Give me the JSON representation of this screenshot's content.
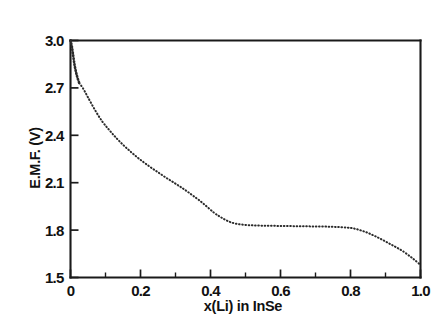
{
  "figure": {
    "background_color": "#ffffff",
    "ink_color": "#1a1a1a",
    "curve_color": "#2b2b2b"
  },
  "chart_data": {
    "type": "line",
    "title": "",
    "subtitle": "",
    "xlabel": "x(Li) in InSe",
    "ylabel": "E.M.F. (V)",
    "xlim": [
      0,
      1.0
    ],
    "ylim": [
      1.5,
      3.0
    ],
    "grid": false,
    "legend": null,
    "legend_position": "none",
    "line_style": "dotted",
    "marker": "none",
    "x_ticks": [
      0,
      0.2,
      0.4,
      0.6,
      0.8,
      1.0
    ],
    "x_tick_labels": [
      "0",
      "0.2",
      "0.4",
      "0.6",
      "0.8",
      "1.0"
    ],
    "x_minor_ticks": [
      0.1,
      0.3,
      0.5,
      0.7,
      0.9
    ],
    "y_ticks": [
      1.5,
      1.8,
      2.1,
      2.4,
      2.7,
      3.0
    ],
    "y_tick_labels": [
      "1.5",
      "1.8",
      "2.1",
      "2.4",
      "2.7",
      "3.0"
    ],
    "y_minor_ticks": [],
    "tick_direction": "in",
    "series": [
      {
        "name": "EMF discharge curve",
        "x": [
          0.0,
          0.004,
          0.008,
          0.012,
          0.018,
          0.025,
          0.035,
          0.05,
          0.07,
          0.09,
          0.11,
          0.13,
          0.15,
          0.17,
          0.19,
          0.21,
          0.23,
          0.25,
          0.27,
          0.29,
          0.31,
          0.33,
          0.35,
          0.37,
          0.39,
          0.41,
          0.425,
          0.44,
          0.455,
          0.47,
          0.49,
          0.52,
          0.55,
          0.58,
          0.61,
          0.64,
          0.67,
          0.7,
          0.73,
          0.76,
          0.79,
          0.81,
          0.83,
          0.85,
          0.87,
          0.89,
          0.91,
          0.93,
          0.95,
          0.97,
          0.985,
          1.0
        ],
        "y": [
          3.0,
          2.96,
          2.9,
          2.84,
          2.78,
          2.73,
          2.7,
          2.64,
          2.56,
          2.49,
          2.435,
          2.385,
          2.34,
          2.3,
          2.262,
          2.228,
          2.196,
          2.166,
          2.136,
          2.108,
          2.08,
          2.05,
          2.018,
          1.985,
          1.948,
          1.91,
          1.888,
          1.868,
          1.852,
          1.842,
          1.835,
          1.83,
          1.828,
          1.827,
          1.826,
          1.825,
          1.824,
          1.823,
          1.822,
          1.82,
          1.816,
          1.81,
          1.798,
          1.782,
          1.762,
          1.74,
          1.716,
          1.692,
          1.666,
          1.634,
          1.608,
          1.58
        ]
      }
    ]
  }
}
